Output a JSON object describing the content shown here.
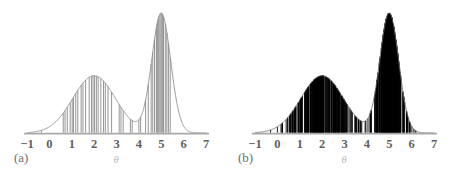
{
  "figure": {
    "width": 456,
    "height": 179,
    "background": "#ffffff",
    "curve_color": "#8a8a8a",
    "axis_color": "#a8a8a8",
    "tick_label_color": "#5f5f5f",
    "caption_color": "#6e6e6e",
    "axis_title_color": "#b9b9b9"
  },
  "panels": [
    {
      "id": "a",
      "caption": "(a)",
      "rug_color": "#7a7a7a",
      "rug_line_width": 0.8,
      "rug_density": "sparse"
    },
    {
      "id": "b",
      "caption": "(b)",
      "rug_color": "#000000",
      "rug_line_width": 1.0,
      "rug_density": "dense"
    }
  ],
  "axis": {
    "title": "θ",
    "tick_labels": [
      "−1",
      "0",
      "1",
      "2",
      "3",
      "4",
      "5",
      "6",
      "7"
    ],
    "tick_values": [
      -1,
      0,
      1,
      2,
      3,
      4,
      5,
      6,
      7
    ],
    "xmin": -1,
    "xmax": 7
  },
  "chart_data": {
    "type": "area",
    "title": "",
    "subtitle": "",
    "xlabel": "θ",
    "ylabel": "",
    "xlim": [
      -1,
      7
    ],
    "ylim": [
      0,
      0.42
    ],
    "grid": false,
    "legend": "none",
    "density_model": {
      "kind": "gaussian-mixture",
      "components": [
        {
          "weight": 0.52,
          "mean": 2.0,
          "sd": 0.95,
          "peak_height": 0.218
        },
        {
          "weight": 0.48,
          "mean": 5.0,
          "sd": 0.42,
          "peak_height": 0.4
        }
      ],
      "modes": [
        2.0,
        5.0
      ],
      "antimode": 3.75,
      "peak_values": [
        0.24,
        0.41
      ]
    },
    "panel_a_samples": [
      -0.35,
      0.62,
      0.7,
      0.8,
      0.93,
      1.02,
      1.08,
      1.18,
      1.27,
      1.42,
      1.5,
      1.62,
      1.78,
      1.88,
      1.95,
      2.02,
      2.1,
      2.18,
      2.3,
      2.42,
      2.5,
      2.62,
      2.78,
      3.12,
      3.2,
      3.3,
      3.62,
      3.7,
      4.0,
      4.08,
      4.3,
      4.42,
      4.55,
      4.62,
      4.7,
      4.78,
      4.82,
      4.86,
      4.9,
      4.95,
      5.0,
      5.05,
      5.1,
      5.18,
      5.25,
      5.32,
      5.4
    ],
    "panel_b_samples_count": 400,
    "panel_b_sample_range": [
      -1.0,
      6.4
    ]
  },
  "geometry": {
    "panel_width": 228,
    "baseline_y": 133,
    "plot_top_y": 13,
    "x_of_minus1": 27,
    "x_of_7": 206,
    "units_per_pixel": 0.0447,
    "mode1_peak_px": [
      105,
      68
    ],
    "mode2_peak_px": [
      177,
      14
    ]
  }
}
